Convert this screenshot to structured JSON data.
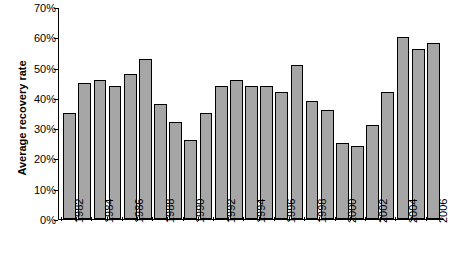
{
  "chart_data": {
    "type": "bar",
    "title": "",
    "xlabel": "",
    "ylabel": "Average recovery rate",
    "ylim": [
      0,
      70
    ],
    "ytick_labels": [
      "0%",
      "10%",
      "20%",
      "30%",
      "40%",
      "50%",
      "60%",
      "70%"
    ],
    "ytick_values": [
      0,
      10,
      20,
      30,
      40,
      50,
      60,
      70
    ],
    "grid": false,
    "legend": null,
    "categories": [
      "1982",
      "1983",
      "1984",
      "1985",
      "1986",
      "1987",
      "1988",
      "1989",
      "1990",
      "1991",
      "1992",
      "1993",
      "1994",
      "1995",
      "1996",
      "1997",
      "1998",
      "1999",
      "2000",
      "2001",
      "2002",
      "2003",
      "2004",
      "2005",
      "2006"
    ],
    "xtick_labels": [
      "1982",
      "1984",
      "1986",
      "1988",
      "1990",
      "1992",
      "1994",
      "1996",
      "1998",
      "2000",
      "2002",
      "2004",
      "2006"
    ],
    "values": [
      35,
      45,
      46,
      44,
      48,
      53,
      38,
      32,
      26,
      35,
      44,
      46,
      44,
      44,
      42,
      51,
      39,
      36,
      25,
      24,
      31,
      42,
      60,
      56,
      58
    ],
    "bar_fill_color": "#a6a6a6",
    "bar_border_color": "#000000",
    "axis_color": "#000000"
  }
}
